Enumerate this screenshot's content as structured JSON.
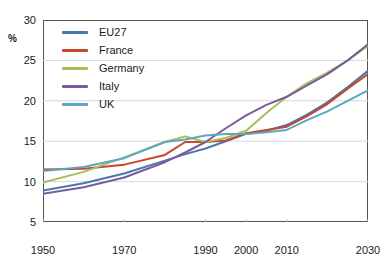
{
  "chart_data": {
    "type": "line",
    "title": "",
    "subtitle": "",
    "xlabel": "",
    "ylabel": "%",
    "xlim": [
      1950,
      2030
    ],
    "ylim": [
      5,
      30
    ],
    "yticks": [
      5,
      10,
      15,
      20,
      25,
      30
    ],
    "xticks": [
      1950,
      1970,
      1990,
      2000,
      2010,
      2030
    ],
    "xtick_labels": [
      "1950",
      "1970",
      "1990",
      "2000",
      "2010",
      "2030"
    ],
    "ytick_labels": [
      "5",
      "10",
      "15",
      "20",
      "25",
      "30"
    ],
    "grid": true,
    "grid_axis": "y",
    "legend_position": "top-left inside",
    "x": [
      1950,
      1960,
      1970,
      1980,
      1985,
      1990,
      1995,
      2000,
      2005,
      2010,
      2015,
      2020,
      2025,
      2030
    ],
    "series": [
      {
        "name": "EU27",
        "color": "#4A76A8",
        "values": [
          8.9,
          9.8,
          11.0,
          12.6,
          13.4,
          14.1,
          15.0,
          15.9,
          16.3,
          17.0,
          18.3,
          19.8,
          21.7,
          23.7
        ]
      },
      {
        "name": "France",
        "color": "#C8462B",
        "values": [
          11.5,
          11.6,
          12.1,
          13.3,
          14.9,
          14.9,
          15.1,
          16.0,
          16.4,
          16.8,
          18.1,
          19.6,
          21.5,
          23.3
        ]
      },
      {
        "name": "Germany",
        "color": "#A7BE57",
        "values": [
          9.9,
          11.2,
          13.0,
          14.9,
          15.6,
          14.9,
          15.4,
          16.3,
          18.5,
          20.5,
          22.2,
          23.5,
          25.0,
          26.8
        ]
      },
      {
        "name": "Italy",
        "color": "#7B5B9E",
        "values": [
          8.5,
          9.3,
          10.5,
          12.4,
          13.6,
          14.9,
          16.6,
          18.2,
          19.5,
          20.5,
          21.9,
          23.3,
          25.0,
          27.0
        ]
      },
      {
        "name": "UK",
        "color": "#5EA7C0",
        "values": [
          11.3,
          11.8,
          12.9,
          14.9,
          15.2,
          15.7,
          15.9,
          15.9,
          16.1,
          16.4,
          17.6,
          18.7,
          20.0,
          21.3
        ]
      }
    ]
  },
  "axis": {
    "y_title": "%"
  },
  "legend": {
    "items": [
      {
        "label": "EU27"
      },
      {
        "label": "France"
      },
      {
        "label": "Germany"
      },
      {
        "label": "Italy"
      },
      {
        "label": "UK"
      }
    ]
  }
}
